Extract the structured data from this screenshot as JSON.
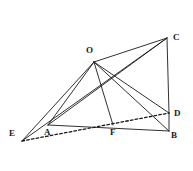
{
  "figure": {
    "type": "geometry-diagram",
    "width": 193,
    "height": 171,
    "background_color": "#ffffff",
    "stroke_color": "#1a1a1a",
    "label_color": "#1a1a1a"
  },
  "labels": {
    "O": "O",
    "C": "C",
    "D": "D",
    "B": "B",
    "F": "F",
    "A": "A",
    "E": "E"
  },
  "points": [
    {
      "name": "O",
      "x": 94,
      "y": 62,
      "label_x": 86,
      "label_y": 46
    },
    {
      "name": "C",
      "x": 167,
      "y": 38,
      "label_x": 173,
      "label_y": 33
    },
    {
      "name": "D",
      "x": 169,
      "y": 113,
      "label_x": 174,
      "label_y": 109
    },
    {
      "name": "B",
      "x": 169,
      "y": 131,
      "label_x": 171,
      "label_y": 131
    },
    {
      "name": "F",
      "x": 113,
      "y": 125,
      "label_x": 110,
      "label_y": 128
    },
    {
      "name": "A",
      "x": 48,
      "y": 125,
      "label_x": 44,
      "label_y": 128
    },
    {
      "name": "E",
      "x": 22,
      "y": 141,
      "label_x": 9,
      "label_y": 129
    }
  ],
  "segments": [
    {
      "name": "O-C",
      "from": "O",
      "to": "C",
      "style": "solid"
    },
    {
      "name": "O-E",
      "from": "O",
      "to": "E",
      "style": "solid"
    },
    {
      "name": "O-A",
      "from": "O",
      "to": "A",
      "style": "solid"
    },
    {
      "name": "O-F",
      "from": "O",
      "to": "F",
      "style": "solid"
    },
    {
      "name": "O-D",
      "from": "O",
      "to": "D",
      "style": "solid"
    },
    {
      "name": "O-B",
      "from": "O",
      "to": "B",
      "style": "solid"
    },
    {
      "name": "C-A",
      "from": "C",
      "to": "A",
      "style": "solid"
    },
    {
      "name": "C-E",
      "from": "C",
      "to": "E",
      "style": "solid"
    },
    {
      "name": "C-D",
      "from": "C",
      "to": "D",
      "style": "solid"
    },
    {
      "name": "D-B",
      "from": "D",
      "to": "B",
      "style": "solid"
    },
    {
      "name": "A-B",
      "from": "A",
      "to": "B",
      "style": "solid"
    },
    {
      "name": "E-D",
      "from": "E",
      "to": "D",
      "style": "dashed"
    }
  ]
}
